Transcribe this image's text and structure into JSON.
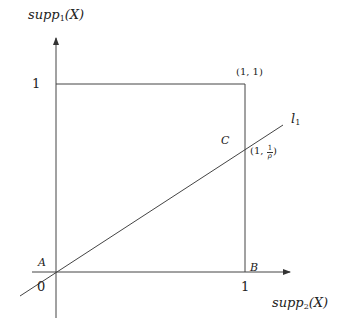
{
  "diagram": {
    "y_axis_label": {
      "base": "supp",
      "sub": "1",
      "rest": "(X)"
    },
    "x_axis_label": {
      "base": "supp",
      "sub": "2",
      "rest": "(X)"
    },
    "y_tick_label": "1",
    "x_tick_label": "1",
    "origin_label": "0",
    "point_A": "A",
    "point_B": "B",
    "point_C": "C",
    "corner_label": "(1, 1)",
    "intersection_label": {
      "prefix": "(1, ",
      "num": "1",
      "den": "ρ",
      "suffix": ")"
    },
    "line_label": {
      "base": "l",
      "sub": "1"
    },
    "colors": {
      "stroke": "#333333",
      "text": "#222222"
    }
  }
}
